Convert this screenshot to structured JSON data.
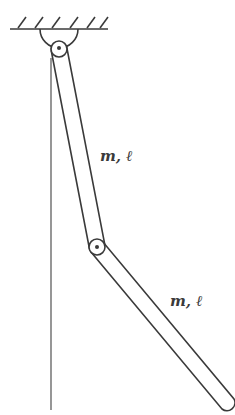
{
  "diagram": {
    "type": "double-pendulum",
    "ceiling": {
      "hatch_count": 6
    },
    "links": [
      {
        "label": "m, ℓ",
        "mass": "m",
        "length": "ℓ"
      },
      {
        "label": "m, ℓ",
        "mass": "m",
        "length": "ℓ"
      }
    ],
    "joints": [
      "top-pivot",
      "middle-joint"
    ],
    "reference_line": "vertical"
  },
  "colors": {
    "stroke": "#3a3a3a",
    "reference": "#6a6a6a",
    "background": "#ffffff"
  }
}
